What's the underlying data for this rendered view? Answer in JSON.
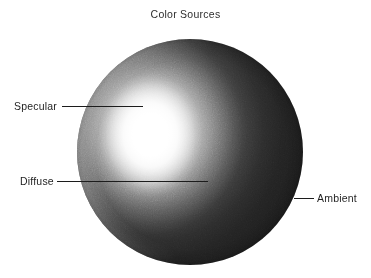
{
  "figure": {
    "title": "Color Sources",
    "width": 371,
    "height": 278,
    "background_color": "#ffffff",
    "text_color": "#1f1f1f",
    "title_color": "#2e2e2e",
    "leader_line_color": "#1c1c1c"
  },
  "sphere": {
    "center_x": 190,
    "center_y": 152,
    "radius": 113,
    "highlight_center_x": 150,
    "highlight_center_y": 135,
    "highlight_color": "#ffffff",
    "midtone_color": "#8c8c8c",
    "shadow_color": "#1d1d1d",
    "rim_color": "#f5f5f5"
  },
  "callouts": [
    {
      "label": "Specular",
      "label_x": 14,
      "label_y": 101,
      "line_x1": 62,
      "line_x2": 143,
      "line_y": 106
    },
    {
      "label": "Diffuse",
      "label_x": 20,
      "label_y": 176,
      "line_x1": 57,
      "line_x2": 208,
      "line_y": 181
    },
    {
      "label": "Ambient",
      "label_x": 317,
      "label_y": 193,
      "line_x1": 294,
      "line_x2": 314,
      "line_y": 198
    }
  ]
}
